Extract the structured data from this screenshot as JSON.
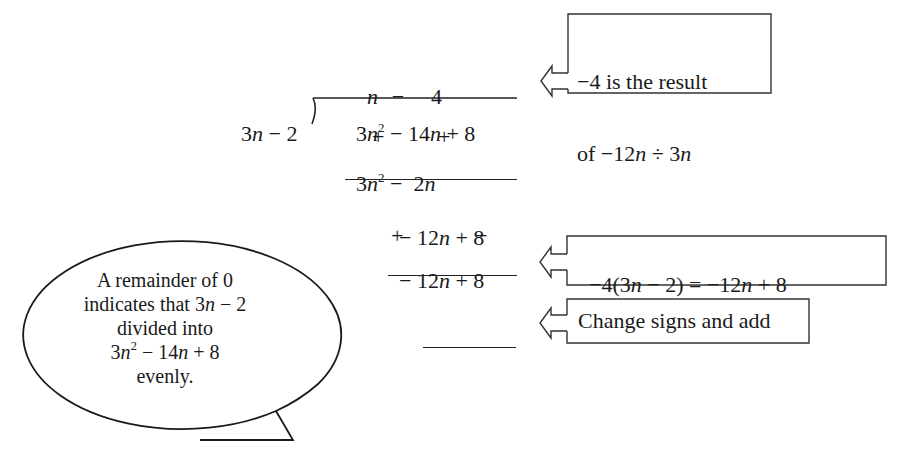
{
  "division": {
    "quotient": {
      "term1": "n",
      "op": "−",
      "term2": "4"
    },
    "divisor": {
      "coef": "3",
      "var": "n",
      "rest": " − 2"
    },
    "dividend": {
      "coef": "3",
      "var": "n",
      "exp": "2",
      "mid": " − 14",
      "var2": "n",
      "tail": " + 8"
    },
    "signs_row1": {
      "s1": "+",
      "s2": "+"
    },
    "subtrahend1": {
      "coef": "3",
      "var": "n",
      "exp": "2",
      "mid": " −  2",
      "var2": "n"
    },
    "remainder1": {
      "lead": "− 12",
      "var": "n",
      "tail": " + 8"
    },
    "signs_row2": {
      "s1": "+",
      "s2": "−"
    },
    "subtrahend2": {
      "lead": "− 12",
      "var": "n",
      "tail": " + 8"
    },
    "final_remainder": ""
  },
  "callouts": [
    {
      "id": "quotient-note",
      "lines": [
        {
          "pre": "−4 is the result",
          "var": "",
          "post": ""
        },
        {
          "pre": "of −12",
          "var": "n",
          "mid": " ÷ 3",
          "var2": "n"
        }
      ],
      "arrow_icon": "left-arrow-icon"
    },
    {
      "id": "multiply-note",
      "parts": {
        "a": "−4(3",
        "v1": "n",
        "b": " − 2) = −12",
        "v2": "n",
        "c": " + 8"
      },
      "arrow_icon": "left-arrow-icon"
    },
    {
      "id": "signs-note",
      "text": "Change signs and add",
      "arrow_icon": "left-arrow-icon"
    }
  ],
  "bubble": {
    "line1": "A remainder of 0",
    "line2_pre": "indicates that 3",
    "line2_var": "n",
    "line2_post": " − 2",
    "line3": "divided into",
    "line4_coef": "3",
    "line4_var": "n",
    "line4_exp": "2",
    "line4_mid": " − 14",
    "line4_var2": "n",
    "line4_tail": " + 8",
    "line5": "evenly."
  },
  "colors": {
    "ink": "#1a1a1a",
    "background": "#ffffff"
  }
}
